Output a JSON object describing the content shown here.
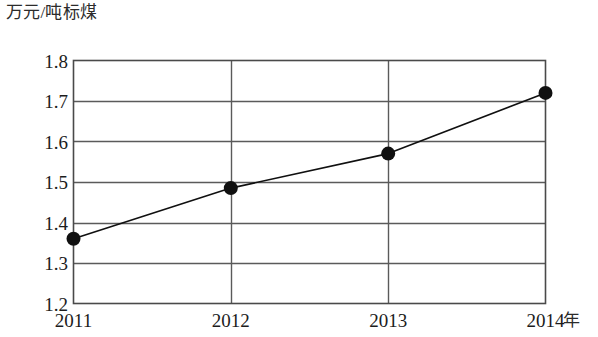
{
  "chart_data": {
    "type": "line",
    "title": "",
    "subtitle": "",
    "xlabel": "年",
    "ylabel": "万元/吨标煤",
    "categories": [
      "2011",
      "2012",
      "2013",
      "2014"
    ],
    "x": [
      2011,
      2012,
      2013,
      2014
    ],
    "values": [
      1.36,
      1.485,
      1.57,
      1.72
    ],
    "series": [
      {
        "name": "单位能耗产值",
        "values": [
          1.36,
          1.485,
          1.57,
          1.72
        ]
      }
    ],
    "ylim": [
      1.2,
      1.8
    ],
    "ytick_labels": [
      "1.8",
      "1.7",
      "1.6",
      "1.5",
      "1.4",
      "1.3",
      "1.2"
    ],
    "ytick_values": [
      1.8,
      1.7,
      1.6,
      1.5,
      1.4,
      1.3,
      1.2
    ],
    "ytick_step": 0.1,
    "grid": {
      "horizontal": true,
      "vertical": true
    },
    "legend": {
      "visible": false,
      "position": "none",
      "entries": []
    },
    "marker": {
      "shape": "circle",
      "filled": true,
      "color": "#101010",
      "radius_px": 7
    },
    "line": {
      "color": "#101010",
      "width_px": 1.6,
      "style": "solid"
    },
    "axis": {
      "frame_color": "#4a4a4a",
      "grid_color": "#5a5a5a",
      "background": "#ffffff"
    },
    "annotations": []
  },
  "colors": {
    "background": "#ffffff",
    "ink": "#1a1a1a",
    "grid": "#5a5a5a",
    "frame": "#4a4a4a",
    "marker": "#101010",
    "line": "#101010"
  }
}
